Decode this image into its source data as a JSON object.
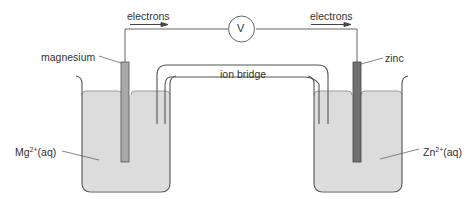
{
  "diagram": {
    "labels": {
      "electrons_left": "electrons",
      "electrons_right": "electrons",
      "voltmeter": "V",
      "magnesium": "magnesium",
      "zinc": "zinc",
      "ion_bridge": "ion bridge",
      "mg_ion_base": "Mg",
      "mg_ion_charge": "2+",
      "mg_ion_state": "(aq)",
      "zn_ion_base": "Zn",
      "zn_ion_charge": "2+",
      "zn_ion_state": "(aq)"
    },
    "colors": {
      "solution": "#dcdcdc",
      "magnesium_electrode": "#a8a8a8",
      "zinc_electrode": "#707070",
      "lines": "#555555",
      "text": "#333333"
    }
  }
}
